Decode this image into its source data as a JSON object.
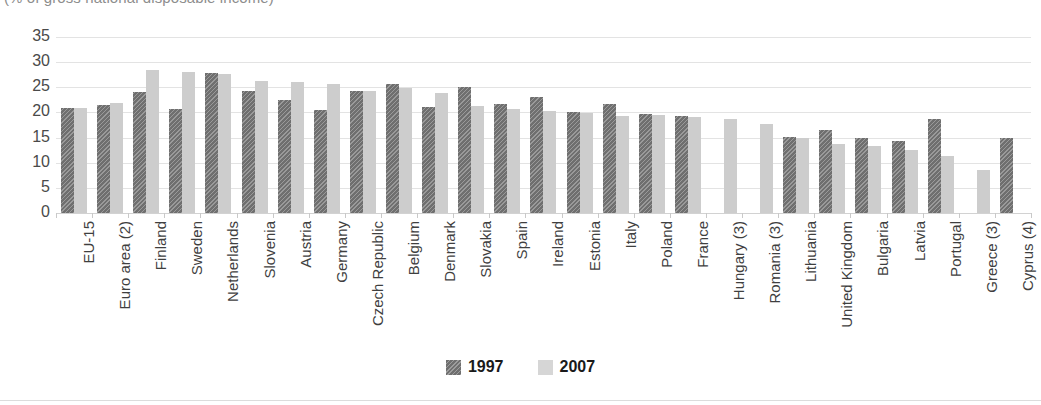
{
  "subtitle": "(% of gross national disposable income)",
  "legend": {
    "position": "bottom-center",
    "items": [
      {
        "label": "1997",
        "swatch": "dark-hatched-swatch",
        "color": "#6f6f6f"
      },
      {
        "label": "2007",
        "swatch": "light-solid-swatch",
        "color": "#cdcdcd"
      }
    ]
  },
  "chart_data": {
    "type": "bar",
    "title": "",
    "subtitle": "(% of gross national disposable income)",
    "xlabel": "",
    "ylabel": "",
    "ylim": [
      0,
      35
    ],
    "yticks": [
      0,
      5,
      10,
      15,
      20,
      25,
      30,
      35
    ],
    "grid": true,
    "legend_position": "bottom-center",
    "categories": [
      "EU-15",
      "Euro area (2)",
      "Finland",
      "Sweden",
      "Netherlands",
      "Slovenia",
      "Austria",
      "Germany",
      "Czech Republic",
      "Belgium",
      "Denmark",
      "Slovakia",
      "Spain",
      "Ireland",
      "Estonia",
      "Italy",
      "Poland",
      "France",
      "Hungary (3)",
      "Romania (3)",
      "Lithuania",
      "United Kingdom",
      "Bulgaria",
      "Latvia",
      "Portugal",
      "Greece (3)",
      "Cyprus (4)"
    ],
    "series": [
      {
        "name": "1997",
        "color": "#6f6f6f",
        "values": [
          20.8,
          21.5,
          24.1,
          20.6,
          27.9,
          24.3,
          22.4,
          20.4,
          24.2,
          25.7,
          21.0,
          25.0,
          21.7,
          23.0,
          20.0,
          21.7,
          19.6,
          19.3,
          null,
          null,
          15.1,
          16.6,
          14.9,
          14.3,
          18.7,
          null,
          14.9
        ]
      },
      {
        "name": "2007",
        "color": "#cdcdcd",
        "values": [
          20.9,
          21.9,
          28.4,
          28.1,
          27.7,
          26.3,
          26.0,
          25.7,
          24.3,
          24.9,
          23.8,
          21.3,
          20.7,
          20.2,
          19.9,
          19.2,
          19.4,
          19.0,
          18.7,
          17.7,
          15.0,
          13.7,
          13.4,
          12.6,
          11.3,
          8.5,
          null
        ]
      }
    ]
  }
}
